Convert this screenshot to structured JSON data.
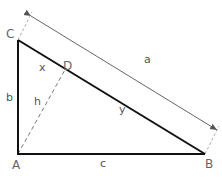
{
  "diagram": {
    "type": "right-triangle-with-altitude",
    "vertices": {
      "A": {
        "label": "A",
        "x": 18,
        "y": 154
      },
      "B": {
        "label": "B",
        "x": 205,
        "y": 154
      },
      "C": {
        "label": "C",
        "x": 18,
        "y": 40
      },
      "D": {
        "label": "D",
        "x": 66,
        "y": 68
      }
    },
    "sides": {
      "a": "a",
      "b": "b",
      "c": "c",
      "h": "h",
      "x": "x",
      "y": "y"
    },
    "colors": {
      "triangle": "#111111",
      "altitude": "#777777",
      "dimension": "#555555",
      "labels": "#555555"
    }
  }
}
